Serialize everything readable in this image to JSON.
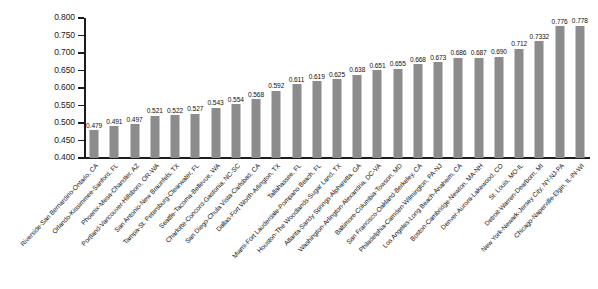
{
  "chart_data": {
    "type": "bar",
    "title": "",
    "xlabel": "",
    "ylabel": "",
    "ylim": [
      0.4,
      0.8
    ],
    "ytick_step": 0.05,
    "yticks": [
      "0.800",
      "0.750",
      "0.700",
      "0.650",
      "0.600",
      "0.550",
      "0.500",
      "0.450",
      "0.400"
    ],
    "grid": false,
    "legend": "none",
    "bar_color": "#8c8c8c",
    "axis_color": "#1c1c1c",
    "value_label_format": "3 decimals (one bar shows 4 decimals)",
    "categories": [
      "Riverside-San Bernardino-Ontario, CA",
      "Orlando-Kissimmee-Sanford, FL",
      "Phoenix-Mesa-Chandler, AZ",
      "Portland-Vancouver-Hillsboro, OR-WA",
      "San Antonio-New Braunfels, TX",
      "Tampa-St. Petersburg-Clearwater, FL",
      "Seattle-Tacoma-Bellevue, WA",
      "Charlotte-Concord-Gastonia, NC-SC",
      "San Diego-Chula Vista-Carlsbad, CA",
      "Dallas-Fort Worth-Arlington, TX",
      "Tallahassee, FL",
      "Miami-Fort Lauderdale-Pompano Beach, FL",
      "Houston-The Woodlands-Sugar Land, TX",
      "Atlanta-Sandy Springs-Alpharetta, GA",
      "Washington-Arlington-Alexandria, DC-VA",
      "Baltimore-Columbia-Towson, MD",
      "San Francisco-Oakland-Berkeley, CA",
      "Philadelphia-Camden-Wilmington, PA-NJ",
      "Los Angeles-Long Beach-Anaheim, CA",
      "Boston-Cambridge-Newton, MA-NH",
      "Denver-Aurora-Lakewood, CO",
      "St. Louis, MO-IL",
      "Detroit-Warren-Dearborn, MI",
      "New York-Newark-Jersey City, NY-NJ-PA",
      "Chicago-Naperville-Elgin, IL-IN-WI"
    ],
    "values": [
      0.479,
      0.491,
      0.497,
      0.521,
      0.522,
      0.527,
      0.543,
      0.554,
      0.568,
      0.592,
      0.611,
      0.619,
      0.625,
      0.638,
      0.651,
      0.655,
      0.668,
      0.673,
      0.686,
      0.687,
      0.69,
      0.712,
      0.7332,
      0.776,
      0.778
    ],
    "value_labels": [
      "0.479",
      "0.491",
      "0.497",
      "0.521",
      "0.522",
      "0.527",
      "0.543",
      "0.554",
      "0.568",
      "0.592",
      "0.611",
      "0.619",
      "0.625",
      "0.638",
      "0.651",
      "0.655",
      "0.668",
      "0.673",
      "0.686",
      "0.687",
      "0.690",
      "0.712",
      "0.7332",
      "0.776",
      "0.778"
    ]
  }
}
